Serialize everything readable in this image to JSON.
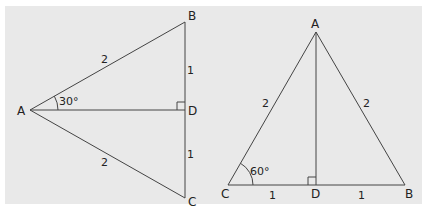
{
  "left_triangle": {
    "vertices": {
      "A": "A",
      "B": "B",
      "C": "C",
      "D": "D"
    },
    "sides": {
      "AB": "2",
      "AC": "2",
      "BD": "1",
      "DC": "1"
    },
    "angle_A": "30°",
    "right_angle_at": "D"
  },
  "right_triangle": {
    "vertices": {
      "A": "A",
      "B": "B",
      "C": "C",
      "D": "D"
    },
    "sides": {
      "AC": "2",
      "AB": "2",
      "CD": "1",
      "DB": "1"
    },
    "angle_C": "60°",
    "right_angle_at": "D"
  },
  "colors": {
    "background": "#e9e9e9",
    "line": "#444444",
    "text": "#222222"
  }
}
